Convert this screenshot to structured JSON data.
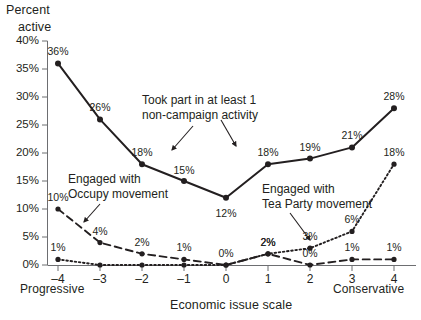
{
  "chart_data": {
    "type": "line",
    "title": "",
    "ylabel": "Percent active",
    "xlabel": "Economic issue scale",
    "x_left_anchor": "Progressive",
    "x_right_anchor": "Conservative",
    "categories": [
      "-4",
      "-3",
      "-2",
      "-1",
      "0",
      "1",
      "2",
      "3",
      "4"
    ],
    "x": [
      -4,
      -3,
      -2,
      -1,
      0,
      1,
      2,
      3,
      4
    ],
    "ylim": [
      0,
      40
    ],
    "xlim": [
      -4.6,
      4.6
    ],
    "ytick_labels": [
      "0%",
      "5%",
      "10%",
      "15%",
      "20%",
      "25%",
      "30%",
      "35%",
      "40%"
    ],
    "ytick_values": [
      0,
      5,
      10,
      15,
      20,
      25,
      30,
      35,
      40
    ],
    "grid": false,
    "legend": "inline-annotations",
    "series": [
      {
        "name": "Took part in at least 1 non-campaign activity",
        "style": "solid",
        "color": "#231f20",
        "values": [
          36,
          26,
          18,
          15,
          12,
          18,
          19,
          21,
          28
        ],
        "labels": [
          "36%",
          "26%",
          "18%",
          "15%",
          "12%",
          "18%",
          "19%",
          "21%",
          "28%"
        ]
      },
      {
        "name": "Engaged with Occupy movement",
        "style": "dashed",
        "color": "#231f20",
        "values": [
          10,
          4,
          2,
          1,
          0,
          2,
          0,
          1,
          1
        ],
        "labels": [
          "10%",
          "4%",
          "2%",
          "1%",
          "0%",
          "2%",
          "0%",
          "1%",
          "1%"
        ]
      },
      {
        "name": "Engaged with Tea Party movement",
        "style": "dotted",
        "color": "#231f20",
        "values": [
          1,
          0,
          0,
          0,
          0,
          2,
          3,
          6,
          18
        ],
        "labels": [
          "1%",
          "0%",
          "0%",
          "0%",
          "0%",
          "2%",
          "3%",
          "6%",
          "18%"
        ]
      }
    ],
    "annotations": [
      {
        "id": "solid",
        "line1": "Took part in at least 1",
        "line2": "non-campaign activity"
      },
      {
        "id": "occupy",
        "line1": "Engaged with",
        "line2": "Occupy movement"
      },
      {
        "id": "tea",
        "line1": "Engaged with",
        "line2": "Tea Party movement"
      }
    ]
  },
  "axes": {
    "y_title_line1": "Percent",
    "y_title_line2": "active"
  }
}
